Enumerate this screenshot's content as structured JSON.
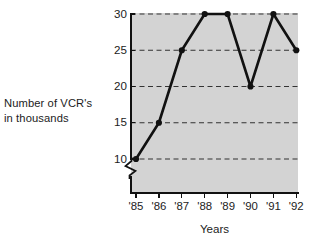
{
  "chart_data": {
    "type": "line",
    "title": "",
    "xlabel": "Years",
    "ylabel": "Number of VCR's in thousands",
    "ylabel_lines": [
      "Number of VCR's",
      "in thousands"
    ],
    "categories": [
      "'85",
      "'86",
      "'87",
      "'88",
      "'89",
      "'90",
      "'91",
      "'92"
    ],
    "values": [
      10,
      15,
      25,
      30,
      30,
      20,
      30,
      25
    ],
    "series": [
      {
        "name": "Number of VCR's in thousands",
        "values": [
          10,
          15,
          25,
          30,
          30,
          20,
          30,
          25
        ]
      }
    ],
    "yticks": [
      10,
      15,
      20,
      25,
      30
    ],
    "ytick_labels": [
      "10",
      "15",
      "20",
      "25",
      "30"
    ],
    "ylim": [
      10,
      30
    ],
    "xlim": [
      "'85",
      "'92"
    ],
    "grid": "horizontal-dashed",
    "y_axis_break": true,
    "legend": "none",
    "marker": "filled-circle",
    "line_color": "#111111",
    "plot_background": "#d3d3d3",
    "page_background": "#ffffff",
    "grid_color": "#333333"
  },
  "axis_labels": {
    "x_title": "Years",
    "y_title_line1": "Number of VCR's",
    "y_title_line2": "in thousands"
  },
  "y_ticks": [
    {
      "label": "30",
      "value": 30
    },
    {
      "label": "25",
      "value": 25
    },
    {
      "label": "20",
      "value": 20
    },
    {
      "label": "15",
      "value": 15
    },
    {
      "label": "10",
      "value": 10
    }
  ],
  "x_ticks": [
    {
      "label": "'85"
    },
    {
      "label": "'86"
    },
    {
      "label": "'87"
    },
    {
      "label": "'88"
    },
    {
      "label": "'89"
    },
    {
      "label": "'90"
    },
    {
      "label": "'91"
    },
    {
      "label": "'92"
    }
  ]
}
